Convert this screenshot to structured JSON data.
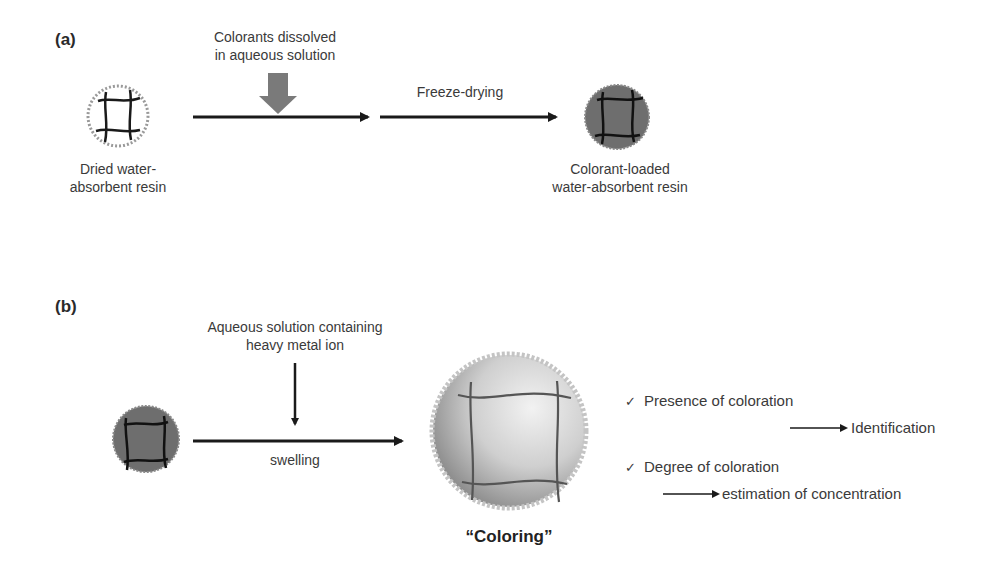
{
  "panel_a": {
    "label": "(a)",
    "step1_label_line1": "Colorants dissolved",
    "step1_label_line2": "in aqueous solution",
    "step2_label": "Freeze-drying",
    "start_label_line1": "Dried water-",
    "start_label_line2": "absorbent resin",
    "end_label_line1": "Colorant-loaded",
    "end_label_line2": "water-absorbent resin"
  },
  "panel_b": {
    "label": "(b)",
    "input_label_line1": "Aqueous solution containing",
    "input_label_line2": "heavy metal ion",
    "arrow_label": "swelling",
    "result_label": "“Coloring”",
    "outcomes": [
      {
        "check": "✓",
        "text": "Presence of coloration",
        "result": "Identification"
      },
      {
        "check": "✓",
        "text": "Degree of coloration",
        "result": "estimation of concentration"
      }
    ]
  },
  "colors": {
    "arrow": "#1a1a1a",
    "gray_arrow": "#7a7a7a",
    "resin_loaded": "#6e6e6e",
    "network_line": "#1a1a1a"
  }
}
